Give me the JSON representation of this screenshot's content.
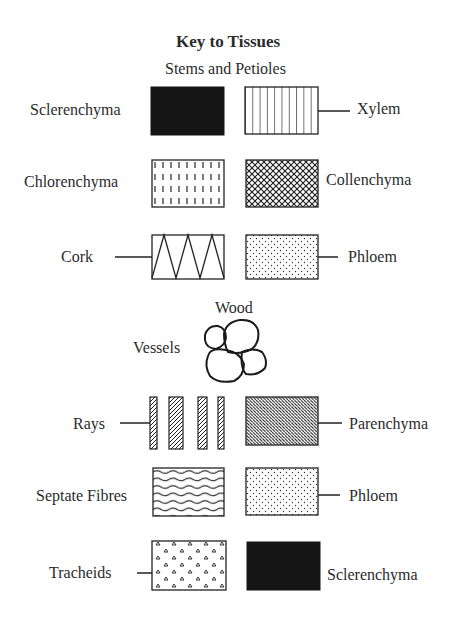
{
  "title": "Key to Tissues",
  "sections": [
    {
      "heading": "Stems and Petioles",
      "rows": [
        {
          "left": {
            "label": "Sclerenchyma",
            "pattern": "solid-black"
          },
          "right": {
            "label": "Xylem",
            "pattern": "vertical-lines"
          }
        },
        {
          "left": {
            "label": "Chlorenchyma",
            "pattern": "dashed-vertical"
          },
          "right": {
            "label": "Collenchyma",
            "pattern": "crosshatch"
          }
        },
        {
          "left": {
            "label": "Cork",
            "pattern": "zigzag"
          },
          "right": {
            "label": "Phloem",
            "pattern": "stipple"
          }
        }
      ]
    },
    {
      "heading": "Wood",
      "vessels": {
        "label": "Vessels",
        "pattern": "cell-cluster"
      },
      "rows": [
        {
          "left": {
            "label": "Rays",
            "pattern": "hatched-strips"
          },
          "right": {
            "label": "Parenchyma",
            "pattern": "dense-diagonal-hatch"
          }
        },
        {
          "left": {
            "label": "Septate Fibres",
            "pattern": "wavy-lines"
          },
          "right": {
            "label": "Phloem",
            "pattern": "stipple"
          }
        },
        {
          "left": {
            "label": "Tracheids",
            "pattern": "triangle-dots"
          },
          "right": {
            "label": "Sclerenchyma",
            "pattern": "solid-black"
          }
        }
      ]
    }
  ]
}
